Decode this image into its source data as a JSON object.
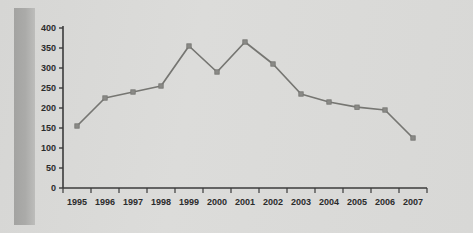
{
  "chart_data": {
    "type": "line",
    "title": "",
    "subtitle": "",
    "xlabel": "",
    "ylabel": "",
    "categories": [
      "1995",
      "1996",
      "1997",
      "1998",
      "1999",
      "2000",
      "2001",
      "2002",
      "2003",
      "2004",
      "2005",
      "2006",
      "2007"
    ],
    "values": [
      155,
      225,
      240,
      255,
      355,
      290,
      365,
      310,
      235,
      215,
      202,
      195,
      125
    ],
    "series": [
      {
        "name": "",
        "values": [
          155,
          225,
          240,
          255,
          355,
          290,
          365,
          310,
          235,
          215,
          202,
          195,
          125
        ]
      }
    ],
    "ylim": [
      0,
      400
    ],
    "ytick_values": [
      0,
      50,
      100,
      150,
      200,
      250,
      300,
      350,
      400
    ],
    "ytick_labels": [
      "0",
      "50",
      "100",
      "150",
      "200",
      "250",
      "300",
      "350",
      "400"
    ],
    "grid": false,
    "legend": false,
    "legend_position": "none",
    "marker": "square",
    "line_color": "#767672",
    "marker_color": "#8a8a86",
    "axis_color": "#3b3b3b",
    "background_color": "#d9d9d7",
    "text_color": "#2b2b2b"
  }
}
